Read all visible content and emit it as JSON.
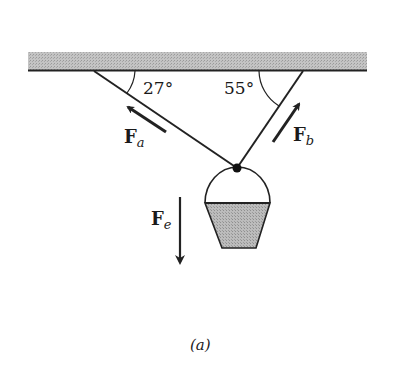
{
  "diagram": {
    "type": "force-diagram",
    "ceiling": {
      "fill": "#bdbdbd",
      "edge": "#222222"
    },
    "angles": {
      "left": {
        "value": "27",
        "unit": "°",
        "label": "27°"
      },
      "right": {
        "value": "55",
        "unit": "°",
        "label": "55°"
      }
    },
    "forces": [
      {
        "id": "a",
        "symbol": "F",
        "subscript": "a",
        "direction": "up-left along left rope"
      },
      {
        "id": "b",
        "symbol": "F",
        "subscript": "b",
        "direction": "up-right along right rope"
      },
      {
        "id": "e",
        "symbol": "F",
        "subscript": "e",
        "direction": "down"
      }
    ],
    "bucket": {
      "fill": "#b5b5b5"
    },
    "caption": "(a)"
  }
}
